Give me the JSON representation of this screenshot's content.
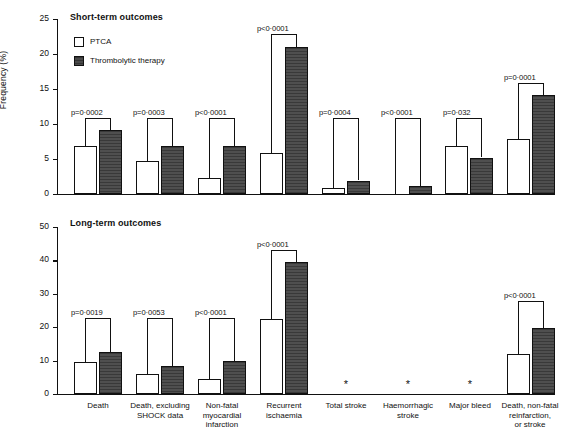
{
  "figure": {
    "ylabel": "Frequency (%)",
    "caption": "",
    "legend": [
      {
        "key": "ptca",
        "label": "PTCA",
        "swatch": "open-square-icon"
      },
      {
        "key": "thrombolytic",
        "label": "Thrombolytic therapy",
        "swatch": "filled-square-icon"
      }
    ],
    "no_data_marker": "*"
  },
  "chart_data": [
    {
      "type": "bar",
      "title": "Short-term outcomes",
      "xlabel": "",
      "ylabel": "Frequency (%)",
      "ylim": [
        0,
        25
      ],
      "yticks": [
        0,
        5,
        10,
        15,
        20,
        25
      ],
      "ytick_labels": [
        "0",
        "5",
        "10",
        "15",
        "20",
        "25"
      ],
      "grid": false,
      "legend_position": "upper-left-inside",
      "categories": [
        "Death",
        "Death, excluding SHOCK data",
        "Non-fatal myocardial infarction",
        "Recurrent ischaemia",
        "Total stroke",
        "Haemorrhagic stroke",
        "Major bleed",
        "Death, non-fatal reinfarction, or stroke"
      ],
      "series": [
        {
          "name": "PTCA",
          "values": [
            6.8,
            4.7,
            2.3,
            5.9,
            0.8,
            0.05,
            6.8,
            7.9
          ]
        },
        {
          "name": "Thrombolytic therapy",
          "values": [
            9.1,
            6.8,
            6.8,
            21.0,
            1.9,
            1.1,
            5.2,
            14.1
          ]
        }
      ],
      "annotations": [
        {
          "category": "Death",
          "text": "p=0·0002"
        },
        {
          "category": "Death, excluding SHOCK data",
          "text": "p=0·0003"
        },
        {
          "category": "Non-fatal myocardial infarction",
          "text": "p<0·0001"
        },
        {
          "category": "Recurrent ischaemia",
          "text": "p<0·0001"
        },
        {
          "category": "Total stroke",
          "text": "p=0·0004"
        },
        {
          "category": "Haemorrhagic stroke",
          "text": "p<0·0001"
        },
        {
          "category": "Major bleed",
          "text": "p=0·032"
        },
        {
          "category": "Death, non-fatal reinfarction, or stroke",
          "text": "p=0·0001"
        }
      ]
    },
    {
      "type": "bar",
      "title": "Long-term outcomes",
      "xlabel": "",
      "ylabel": "Frequency (%)",
      "ylim": [
        0,
        50
      ],
      "yticks": [
        0,
        10,
        20,
        30,
        40,
        50
      ],
      "ytick_labels": [
        "0",
        "10",
        "20",
        "30",
        "40",
        "50"
      ],
      "grid": false,
      "legend_position": "none",
      "categories": [
        "Death",
        "Death, excluding SHOCK data",
        "Non-fatal myocardial infarction",
        "Recurrent ischaemia",
        "Total stroke",
        "Haemorrhagic stroke",
        "Major bleed",
        "Death, non-fatal reinfarction, or stroke"
      ],
      "series": [
        {
          "name": "PTCA",
          "values": [
            9.7,
            6.1,
            4.6,
            22.4,
            null,
            null,
            null,
            12.1
          ]
        },
        {
          "name": "Thrombolytic therapy",
          "values": [
            12.6,
            8.5,
            10.0,
            39.4,
            null,
            null,
            null,
            19.8
          ]
        }
      ],
      "annotations": [
        {
          "category": "Death",
          "text": "p=0·0019"
        },
        {
          "category": "Death, excluding SHOCK data",
          "text": "p=0·0053"
        },
        {
          "category": "Non-fatal myocardial infarction",
          "text": "p<0·0001"
        },
        {
          "category": "Recurrent ischaemia",
          "text": "p<0·0001"
        },
        {
          "category": "Death, non-fatal reinfarction, or stroke",
          "text": "p<0·0001"
        }
      ]
    }
  ],
  "xaxis": {
    "labels": [
      "Death",
      "Death, excluding\nSHOCK data",
      "Non-fatal\nmyocardial\ninfarction",
      "Recurrent\nischaemia",
      "Total stroke",
      "Haemorrhagic\nstroke",
      "Major bleed",
      "Death, non-fatal\nreinfarction,\nor stroke"
    ]
  }
}
